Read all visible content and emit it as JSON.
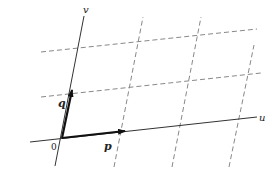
{
  "diagram": {
    "type": "oblique coordinate lattice",
    "axes": {
      "u": {
        "label": "u"
      },
      "v": {
        "label": "v"
      }
    },
    "origin": {
      "label": "0"
    },
    "vectors": {
      "p": {
        "label": "p"
      },
      "q": {
        "label": "q"
      }
    },
    "colors": {
      "axis": "#333333",
      "grid": "#888888",
      "vector": "#111111",
      "background": "#ffffff"
    }
  }
}
